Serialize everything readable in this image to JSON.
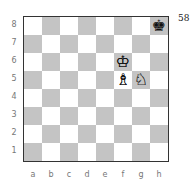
{
  "diagram": {
    "number": "58",
    "files": [
      "a",
      "b",
      "c",
      "d",
      "e",
      "f",
      "g",
      "h"
    ],
    "ranks": [
      "8",
      "7",
      "6",
      "5",
      "4",
      "3",
      "2",
      "1"
    ],
    "colors": {
      "light": "#ffffff",
      "dark": "#c4c4c4",
      "border": "#333333"
    },
    "pieces": [
      {
        "square": "h8",
        "color": "black",
        "type": "king",
        "glyph": "♚"
      },
      {
        "square": "f6",
        "color": "white",
        "type": "king",
        "glyph": "♔"
      },
      {
        "square": "f5",
        "color": "white",
        "type": "bishop",
        "glyph": "♗"
      },
      {
        "square": "g5",
        "color": "white",
        "type": "knight",
        "glyph": "♘"
      }
    ]
  }
}
